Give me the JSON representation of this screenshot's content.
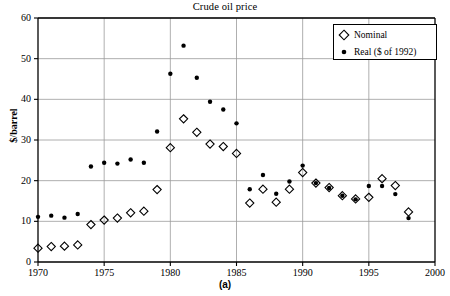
{
  "chart_data": {
    "type": "scatter",
    "title": "Crude oil price",
    "xlabel": "",
    "ylabel": "$/barrel",
    "panel_caption": "(a)",
    "xlim": [
      1970,
      2000
    ],
    "ylim": [
      0,
      60
    ],
    "xticks": [
      1970,
      1975,
      1980,
      1985,
      1990,
      1995,
      2000
    ],
    "yticks": [
      0,
      10,
      20,
      30,
      40,
      50,
      60
    ],
    "grid": true,
    "legend_position": "top-right",
    "x": [
      1970,
      1971,
      1972,
      1973,
      1974,
      1975,
      1976,
      1977,
      1978,
      1979,
      1980,
      1981,
      1982,
      1983,
      1984,
      1985,
      1986,
      1987,
      1988,
      1989,
      1990,
      1991,
      1992,
      1993,
      1994,
      1995,
      1996,
      1997,
      1998
    ],
    "series": [
      {
        "name": "Nominal",
        "marker": "open-diamond",
        "color": "#000000",
        "values": [
          3.4,
          3.8,
          3.9,
          4.2,
          9.2,
          10.3,
          10.8,
          12.1,
          12.5,
          17.8,
          28.1,
          35.2,
          31.9,
          29.0,
          28.4,
          26.7,
          14.5,
          17.9,
          14.7,
          17.9,
          22.0,
          19.4,
          18.3,
          16.3,
          15.5,
          15.9,
          20.5,
          18.8,
          12.3
        ]
      },
      {
        "name": "Real ($ of 1992)",
        "marker": "filled-circle",
        "color": "#000000",
        "values": [
          11.1,
          11.4,
          10.9,
          11.8,
          23.5,
          24.4,
          24.2,
          25.2,
          24.4,
          32.1,
          46.3,
          53.2,
          45.3,
          39.4,
          37.5,
          34.1,
          17.9,
          21.4,
          16.8,
          19.8,
          23.7,
          19.4,
          18.2,
          16.3,
          15.4,
          18.7,
          18.7,
          16.7,
          10.8
        ]
      }
    ]
  },
  "axis": {
    "ytick_labels": [
      "0",
      "10",
      "20",
      "30",
      "40",
      "50",
      "60"
    ],
    "xtick_labels": [
      "1970",
      "1975",
      "1980",
      "1985",
      "1990",
      "1995",
      "2000"
    ]
  },
  "legend": {
    "entries": [
      {
        "label": "Nominal",
        "marker": "open-diamond"
      },
      {
        "label": "Real ($ of 1992)",
        "marker": "filled-circle"
      }
    ]
  },
  "colors": {
    "axis": "#000000",
    "grid": "#9a9a9a",
    "marker": "#000000",
    "background": "#ffffff"
  }
}
